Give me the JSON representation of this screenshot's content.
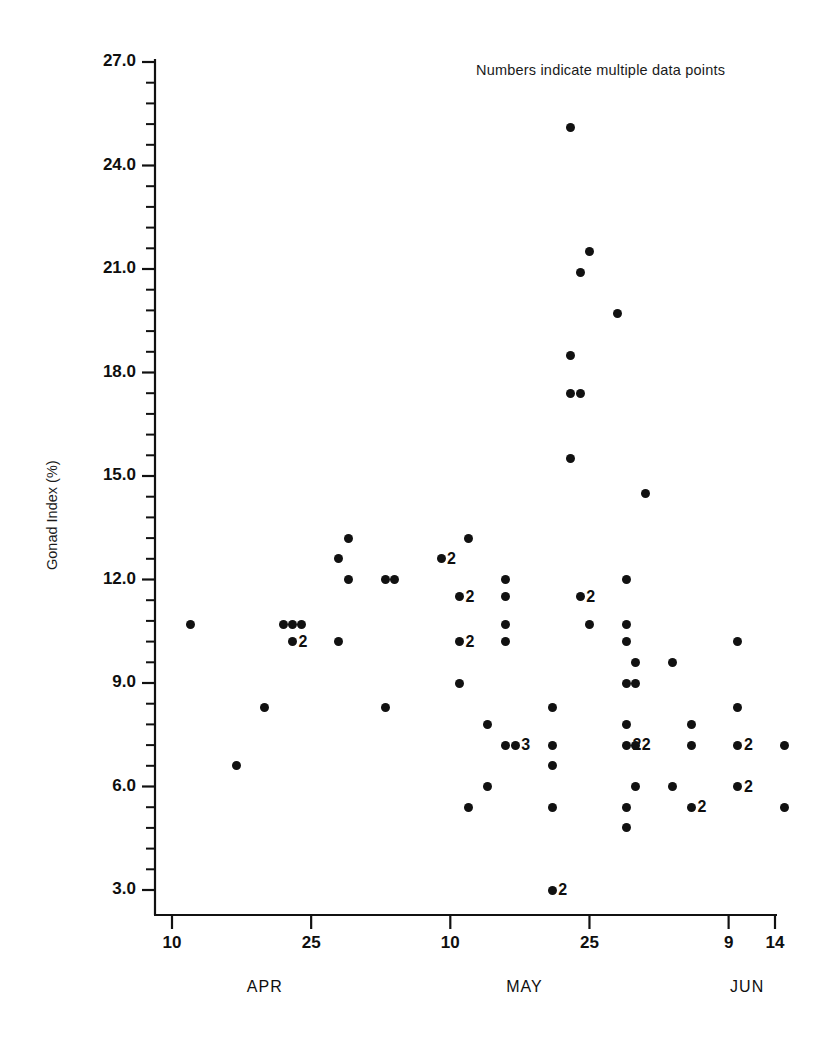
{
  "annotation": {
    "note": "Numbers indicate multiple data points"
  },
  "chart_data": {
    "type": "scatter",
    "title": "",
    "annotations": [
      "Numbers indicate multiple data points"
    ],
    "xlabel": "",
    "ylabel": "Gonad Index (%)",
    "ylim": [
      3.0,
      27.0
    ],
    "yticks": [
      "3.0",
      "6.0",
      "9.0",
      "12.0",
      "15.0",
      "18.0",
      "21.0",
      "24.0",
      "27.0"
    ],
    "ytick_values": [
      3.0,
      6.0,
      9.0,
      12.0,
      15.0,
      18.0,
      21.0,
      24.0,
      27.0
    ],
    "y_minor_ticks_per_interval": 5,
    "grid": false,
    "legend": "none",
    "xticks": [
      "10",
      "25",
      "10",
      "25",
      "9",
      "14"
    ],
    "xtick_days": [
      0,
      15,
      30,
      45,
      60,
      65
    ],
    "xtick_dates": [
      "APR 10",
      "APR 25",
      "MAY 10",
      "MAY 25",
      "JUN 9",
      "JUN 14"
    ],
    "xlim_days": [
      -3,
      68
    ],
    "month_labels": [
      "APR",
      "MAY",
      "JUN"
    ],
    "month_positions_days": [
      10,
      38,
      62
    ],
    "points": [
      {
        "day": 2,
        "y": 10.7,
        "n": 1
      },
      {
        "day": 7,
        "y": 6.6,
        "n": 1
      },
      {
        "day": 10,
        "y": 8.3,
        "n": 1
      },
      {
        "day": 12,
        "y": 10.7,
        "n": 1
      },
      {
        "day": 13,
        "y": 10.7,
        "n": 1
      },
      {
        "day": 13,
        "y": 10.2,
        "n": 2,
        "label": "2"
      },
      {
        "day": 14,
        "y": 10.7,
        "n": 1
      },
      {
        "day": 18,
        "y": 12.6,
        "n": 1
      },
      {
        "day": 18,
        "y": 10.2,
        "n": 1
      },
      {
        "day": 19,
        "y": 13.2,
        "n": 1
      },
      {
        "day": 19,
        "y": 12.0,
        "n": 1
      },
      {
        "day": 23,
        "y": 8.3,
        "n": 1
      },
      {
        "day": 23,
        "y": 12.0,
        "n": 1
      },
      {
        "day": 24,
        "y": 12.0,
        "n": 1
      },
      {
        "day": 29,
        "y": 12.6,
        "n": 2,
        "label": "2"
      },
      {
        "day": 31,
        "y": 11.5,
        "n": 2,
        "label": "2"
      },
      {
        "day": 31,
        "y": 9.0,
        "n": 1
      },
      {
        "day": 31,
        "y": 10.2,
        "n": 2,
        "label": "2"
      },
      {
        "day": 32,
        "y": 13.2,
        "n": 1
      },
      {
        "day": 32,
        "y": 5.4,
        "n": 1
      },
      {
        "day": 34,
        "y": 7.8,
        "n": 1
      },
      {
        "day": 34,
        "y": 6.0,
        "n": 1
      },
      {
        "day": 36,
        "y": 12.0,
        "n": 1
      },
      {
        "day": 36,
        "y": 11.5,
        "n": 1
      },
      {
        "day": 36,
        "y": 10.7,
        "n": 1
      },
      {
        "day": 36,
        "y": 10.2,
        "n": 1
      },
      {
        "day": 36,
        "y": 7.2,
        "n": 1
      },
      {
        "day": 37,
        "y": 7.2,
        "n": 3,
        "label": "3"
      },
      {
        "day": 41,
        "y": 3.0,
        "n": 2,
        "label": "2"
      },
      {
        "day": 41,
        "y": 5.4,
        "n": 1
      },
      {
        "day": 41,
        "y": 6.6,
        "n": 1
      },
      {
        "day": 41,
        "y": 7.2,
        "n": 1
      },
      {
        "day": 41,
        "y": 8.3,
        "n": 1
      },
      {
        "day": 43,
        "y": 25.1,
        "n": 1
      },
      {
        "day": 43,
        "y": 18.5,
        "n": 1
      },
      {
        "day": 43,
        "y": 17.4,
        "n": 1
      },
      {
        "day": 43,
        "y": 15.5,
        "n": 1
      },
      {
        "day": 44,
        "y": 11.5,
        "n": 2,
        "label": "2"
      },
      {
        "day": 44,
        "y": 20.9,
        "n": 1
      },
      {
        "day": 44,
        "y": 17.4,
        "n": 1
      },
      {
        "day": 45,
        "y": 21.5,
        "n": 1
      },
      {
        "day": 45,
        "y": 10.7,
        "n": 1
      },
      {
        "day": 48,
        "y": 19.7,
        "n": 1
      },
      {
        "day": 49,
        "y": 12.0,
        "n": 1
      },
      {
        "day": 49,
        "y": 10.7,
        "n": 1
      },
      {
        "day": 49,
        "y": 10.2,
        "n": 1
      },
      {
        "day": 49,
        "y": 9.0,
        "n": 1
      },
      {
        "day": 49,
        "y": 7.8,
        "n": 1
      },
      {
        "day": 49,
        "y": 7.2,
        "n": 2,
        "label": "2"
      },
      {
        "day": 49,
        "y": 5.4,
        "n": 1
      },
      {
        "day": 49,
        "y": 4.8,
        "n": 1
      },
      {
        "day": 50,
        "y": 9.6,
        "n": 1
      },
      {
        "day": 50,
        "y": 9.0,
        "n": 1
      },
      {
        "day": 50,
        "y": 7.2,
        "n": 2,
        "label": "2"
      },
      {
        "day": 50,
        "y": 6.0,
        "n": 1
      },
      {
        "day": 51,
        "y": 14.5,
        "n": 1
      },
      {
        "day": 54,
        "y": 9.6,
        "n": 1
      },
      {
        "day": 54,
        "y": 6.0,
        "n": 1
      },
      {
        "day": 56,
        "y": 7.8,
        "n": 1
      },
      {
        "day": 56,
        "y": 7.2,
        "n": 1
      },
      {
        "day": 56,
        "y": 5.4,
        "n": 2,
        "label": "2"
      },
      {
        "day": 61,
        "y": 10.2,
        "n": 1
      },
      {
        "day": 61,
        "y": 8.3,
        "n": 1
      },
      {
        "day": 61,
        "y": 7.2,
        "n": 2,
        "label": "2"
      },
      {
        "day": 61,
        "y": 6.0,
        "n": 2,
        "label": "2"
      },
      {
        "day": 66,
        "y": 7.2,
        "n": 1
      },
      {
        "day": 66,
        "y": 5.4,
        "n": 1
      }
    ]
  }
}
